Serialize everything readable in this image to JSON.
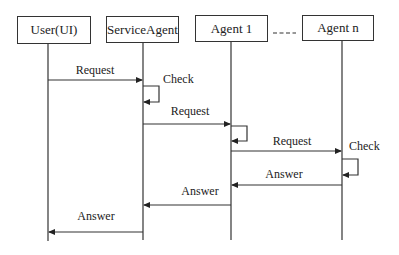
{
  "diagram": {
    "type": "sequence",
    "participants": [
      {
        "id": "user",
        "label": "User(UI)"
      },
      {
        "id": "service",
        "label": "ServiceAgent"
      },
      {
        "id": "agent1",
        "label": "Agent 1"
      },
      {
        "id": "agentn",
        "label": "Agent n"
      }
    ],
    "ellipsis": "----",
    "messages": [
      {
        "from": "user",
        "to": "service",
        "label": "Request"
      },
      {
        "from": "service",
        "to": "service",
        "label": "Check",
        "self": true
      },
      {
        "from": "service",
        "to": "agent1",
        "label": "Request"
      },
      {
        "from": "agent1",
        "to": "agent1",
        "label": "",
        "self": true
      },
      {
        "from": "agent1",
        "to": "agentn",
        "label": "Request"
      },
      {
        "from": "agentn",
        "to": "agentn",
        "label": "Check",
        "self": true
      },
      {
        "from": "agentn",
        "to": "agent1",
        "label": "Answer"
      },
      {
        "from": "agent1",
        "to": "service",
        "label": "Answer"
      },
      {
        "from": "service",
        "to": "user",
        "label": "Answer"
      }
    ]
  }
}
